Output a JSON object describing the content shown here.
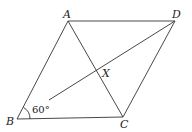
{
  "diagram": {
    "type": "rhombus-geometry",
    "points": {
      "A": {
        "label": "A",
        "x": 68,
        "y": 21
      },
      "D": {
        "label": "D",
        "x": 175,
        "y": 21
      },
      "B": {
        "label": "B",
        "x": 17,
        "y": 119
      },
      "C": {
        "label": "C",
        "x": 123,
        "y": 117
      },
      "X": {
        "label": "X",
        "x": 100,
        "y": 72
      }
    },
    "angle_label": "60°",
    "segments": [
      "AB",
      "BC",
      "CD",
      "DA",
      "AC",
      "BD (partial, from near angle label to D)"
    ]
  }
}
